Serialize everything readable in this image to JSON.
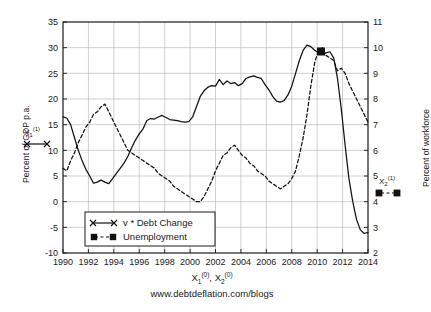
{
  "credit": "www.debtdeflation.com/blogs",
  "axes": {
    "xlabel_parts": {
      "x1": "X",
      "x1_sub": "1",
      "x1_sup": "(0)",
      "sep": ", ",
      "x2": "X",
      "x2_sub": "2",
      "x2_sup": "(0)"
    },
    "ylabel_left": "Percent of GDP p.a.",
    "ylabel_right": "Percent of workforce",
    "x_ticks": [
      "1990",
      "1992",
      "1994",
      "1996",
      "1998",
      "2000",
      "2002",
      "2004",
      "2006",
      "2008",
      "2010",
      "2012",
      "2014"
    ],
    "y_ticks_left": [
      "-10",
      "-5",
      "0",
      "5",
      "10",
      "15",
      "20",
      "25",
      "30",
      "35"
    ],
    "y_ticks_right": [
      "2",
      "3",
      "4",
      "5",
      "6",
      "7",
      "8",
      "9",
      "10",
      "11"
    ]
  },
  "side_markers": {
    "left": {
      "name": "X",
      "sub": "1",
      "sup": "(1)"
    },
    "right": {
      "name": "X",
      "sub": "2",
      "sup": "(1)"
    }
  },
  "legend": {
    "items": [
      {
        "label": "v * Debt Change",
        "style": "solid-x"
      },
      {
        "label": "Unemployment",
        "style": "dashed-square"
      }
    ]
  },
  "chart_data": {
    "type": "line",
    "title": "",
    "xlabel": "X1(0), X2(0)",
    "ylabel": "Percent of GDP p.a.",
    "ylabel_right": "Percent of workforce",
    "xlim": [
      1990,
      2014
    ],
    "ylim": [
      -10,
      35
    ],
    "ylim_right": [
      2,
      11
    ],
    "grid": true,
    "legend_position": "lower-left",
    "series": [
      {
        "name": "v * Debt Change",
        "axis": "left",
        "unit": "Percent of GDP p.a.",
        "line": "solid",
        "marker": "x",
        "x": [
          1990.0,
          1990.3,
          1990.6,
          1990.9,
          1991.2,
          1991.5,
          1991.8,
          1992.1,
          1992.4,
          1992.7,
          1993.0,
          1993.3,
          1993.6,
          1993.9,
          1994.2,
          1994.5,
          1994.8,
          1995.1,
          1995.4,
          1995.7,
          1996.0,
          1996.3,
          1996.6,
          1996.9,
          1997.2,
          1997.5,
          1997.8,
          1998.1,
          1998.4,
          1998.7,
          1999.0,
          1999.3,
          1999.6,
          1999.9,
          2000.2,
          2000.5,
          2000.8,
          2001.1,
          2001.4,
          2001.7,
          2002.0,
          2002.3,
          2002.6,
          2002.9,
          2003.2,
          2003.5,
          2003.8,
          2004.1,
          2004.4,
          2004.7,
          2005.0,
          2005.3,
          2005.6,
          2005.9,
          2006.2,
          2006.5,
          2006.8,
          2007.1,
          2007.4,
          2007.7,
          2008.0,
          2008.3,
          2008.6,
          2008.9,
          2009.2,
          2009.5,
          2009.8,
          2010.1,
          2010.4,
          2010.7,
          2011.0,
          2011.3,
          2011.6,
          2011.9,
          2012.2,
          2012.5,
          2012.8,
          2013.1,
          2013.4,
          2013.7,
          2014.0
        ],
        "y": [
          16.5,
          16.3,
          15.0,
          12.5,
          10.0,
          8.0,
          6.3,
          5.0,
          3.6,
          3.8,
          4.2,
          3.8,
          3.5,
          4.5,
          5.5,
          6.5,
          7.5,
          8.8,
          10.5,
          12.0,
          13.2,
          14.2,
          15.8,
          16.2,
          16.1,
          16.5,
          16.8,
          16.4,
          16.0,
          15.9,
          15.8,
          15.6,
          15.5,
          15.6,
          16.5,
          18.5,
          20.5,
          21.6,
          22.3,
          22.6,
          22.5,
          23.8,
          22.8,
          23.5,
          23.0,
          23.2,
          22.6,
          23.0,
          24.0,
          24.3,
          24.5,
          24.2,
          24.0,
          22.8,
          21.8,
          20.5,
          19.6,
          19.4,
          19.7,
          20.8,
          22.5,
          25.0,
          27.5,
          29.5,
          30.5,
          30.2,
          29.5,
          29.0,
          28.8,
          29.0,
          29.2,
          28.0,
          24.0,
          18.0,
          11.0,
          4.5,
          0.0,
          -3.5,
          -5.5,
          -6.2,
          -6.0
        ]
      },
      {
        "name": "Unemployment",
        "axis": "right",
        "unit": "Percent of workforce",
        "line": "dashed",
        "marker": "square",
        "x": [
          1990.0,
          1990.3,
          1990.6,
          1990.9,
          1991.2,
          1991.5,
          1991.8,
          1992.1,
          1992.4,
          1992.7,
          1993.0,
          1993.3,
          1993.6,
          1993.9,
          1994.2,
          1994.5,
          1994.8,
          1995.1,
          1995.4,
          1995.7,
          1996.0,
          1996.3,
          1996.6,
          1996.9,
          1997.2,
          1997.5,
          1997.8,
          1998.1,
          1998.4,
          1998.7,
          1999.0,
          1999.3,
          1999.6,
          1999.9,
          2000.2,
          2000.5,
          2000.8,
          2001.1,
          2001.4,
          2001.7,
          2002.0,
          2002.3,
          2002.6,
          2002.9,
          2003.2,
          2003.5,
          2003.8,
          2004.1,
          2004.4,
          2004.7,
          2005.0,
          2005.3,
          2005.6,
          2005.9,
          2006.2,
          2006.5,
          2006.8,
          2007.1,
          2007.4,
          2007.7,
          2008.0,
          2008.3,
          2008.6,
          2008.9,
          2009.2,
          2009.5,
          2009.8,
          2010.1,
          2010.4,
          2010.7,
          2011.0,
          2011.3,
          2011.6,
          2011.9,
          2012.2,
          2012.5,
          2012.8,
          2013.1,
          2013.4,
          2013.7,
          2014.0
        ],
        "y": [
          5.3,
          5.2,
          5.6,
          5.9,
          6.3,
          6.6,
          6.9,
          7.1,
          7.4,
          7.5,
          7.7,
          7.8,
          7.5,
          7.2,
          6.9,
          6.6,
          6.3,
          6.0,
          5.9,
          5.8,
          5.7,
          5.6,
          5.5,
          5.4,
          5.3,
          5.1,
          5.0,
          4.9,
          4.8,
          4.6,
          4.5,
          4.4,
          4.3,
          4.2,
          4.1,
          4.0,
          4.0,
          4.2,
          4.5,
          4.8,
          5.2,
          5.5,
          5.8,
          5.9,
          6.1,
          6.2,
          6.0,
          5.8,
          5.7,
          5.5,
          5.4,
          5.2,
          5.1,
          5.0,
          4.8,
          4.7,
          4.6,
          4.5,
          4.6,
          4.7,
          4.9,
          5.2,
          5.8,
          6.5,
          7.4,
          8.5,
          9.4,
          9.9,
          10.0,
          9.7,
          9.6,
          9.5,
          9.1,
          9.2,
          9.0,
          8.6,
          8.3,
          8.0,
          7.7,
          7.4,
          7.1
        ]
      }
    ],
    "annotated_markers": [
      {
        "series": "Unemployment",
        "x": 2010.3,
        "y": 9.85,
        "note": "filled square marker"
      }
    ]
  }
}
